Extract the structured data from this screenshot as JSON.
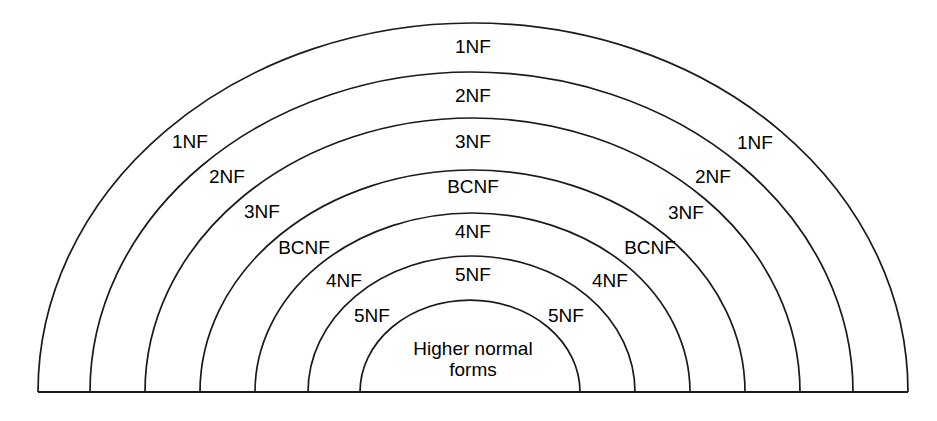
{
  "diagram": {
    "type": "nested-semicircle-hierarchy",
    "background_color": "#ffffff",
    "stroke_color": "#1a1a1a",
    "baseline": {
      "y": 392,
      "x_start": 38,
      "x_end": 908
    },
    "center_x": 473,
    "arcs": [
      {
        "index": 1,
        "label": "1NF",
        "apex_y": 23,
        "left_foot_x": 38,
        "right_foot_x": 908,
        "rx": 435,
        "ry": 369
      },
      {
        "index": 2,
        "label": "2NF",
        "apex_y": 72,
        "left_foot_x": 90,
        "right_foot_x": 853,
        "rx": 383,
        "ry": 320
      },
      {
        "index": 3,
        "label": "3NF",
        "apex_y": 118,
        "left_foot_x": 145,
        "right_foot_x": 800,
        "rx": 328,
        "ry": 274
      },
      {
        "index": 4,
        "label": "BCNF",
        "apex_y": 170,
        "left_foot_x": 200,
        "right_foot_x": 745,
        "rx": 273,
        "ry": 222
      },
      {
        "index": 5,
        "label": "4NF",
        "apex_y": 213,
        "left_foot_x": 255,
        "right_foot_x": 690,
        "rx": 218,
        "ry": 179
      },
      {
        "index": 6,
        "label": "5NF",
        "apex_y": 256,
        "left_foot_x": 308,
        "right_foot_x": 635,
        "rx": 164,
        "ry": 136
      },
      {
        "index": 7,
        "label": "Higher normal forms",
        "apex_y": 300,
        "left_foot_x": 360,
        "right_foot_x": 580,
        "rx": 110,
        "ry": 92
      }
    ],
    "labels": {
      "top": [
        {
          "text": "1NF",
          "x": 473,
          "y": 46
        },
        {
          "text": "2NF",
          "x": 473,
          "y": 95
        },
        {
          "text": "3NF",
          "x": 473,
          "y": 141
        },
        {
          "text": "BCNF",
          "x": 473,
          "y": 186
        },
        {
          "text": "4NF",
          "x": 473,
          "y": 231
        },
        {
          "text": "5NF",
          "x": 473,
          "y": 274
        }
      ],
      "left": [
        {
          "text": "1NF",
          "x": 190,
          "y": 141
        },
        {
          "text": "2NF",
          "x": 227,
          "y": 176
        },
        {
          "text": "3NF",
          "x": 262,
          "y": 211
        },
        {
          "text": "BCNF",
          "x": 304,
          "y": 247
        },
        {
          "text": "4NF",
          "x": 344,
          "y": 280
        },
        {
          "text": "5NF",
          "x": 372,
          "y": 315
        }
      ],
      "right": [
        {
          "text": "1NF",
          "x": 755,
          "y": 142
        },
        {
          "text": "2NF",
          "x": 713,
          "y": 176
        },
        {
          "text": "3NF",
          "x": 686,
          "y": 212
        },
        {
          "text": "BCNF",
          "x": 650,
          "y": 247
        },
        {
          "text": "4NF",
          "x": 610,
          "y": 280
        },
        {
          "text": "5NF",
          "x": 566,
          "y": 315
        }
      ],
      "core": {
        "line1": "Higher normal",
        "line2": "forms",
        "x": 473,
        "y": 359
      }
    }
  }
}
